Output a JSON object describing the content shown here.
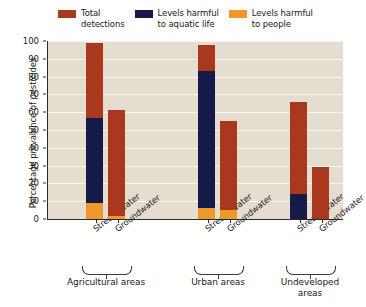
{
  "legend": {
    "items": [
      {
        "label": "Total\ndetections",
        "color": "#a8391c"
      },
      {
        "label": "Levels harmful\nto aquatic life",
        "color": "#151b46"
      },
      {
        "label": "Levels harmful\nto people",
        "color": "#f0982b"
      }
    ]
  },
  "axes": {
    "ylabel": "Percentage prevalence of pesticides",
    "yticks": [
      "0",
      "10",
      "20",
      "30",
      "40",
      "50",
      "60",
      "70",
      "80",
      "90",
      "100"
    ]
  },
  "groups": [
    {
      "label": "Agricultural areas"
    },
    {
      "label": "Urban areas"
    },
    {
      "label": "Undeveloped\nareas"
    }
  ],
  "bars": [
    {
      "name": "Stream water"
    },
    {
      "name": "Groundwater"
    },
    {
      "name": "Stream water"
    },
    {
      "name": "Groundwater"
    },
    {
      "name": "Stream water"
    },
    {
      "name": "Groundwater"
    }
  ],
  "chart_data": {
    "type": "bar",
    "title": "",
    "xlabel": "",
    "ylabel": "Percentage prevalence of pesticides",
    "ylim": [
      0,
      100
    ],
    "ytick_step": 10,
    "grid": true,
    "legend_position": "top",
    "stacked": "overlaid",
    "categories": [
      "Agricultural areas - Stream water",
      "Agricultural areas - Groundwater",
      "Urban areas - Stream water",
      "Urban areas - Groundwater",
      "Undeveloped areas - Stream water",
      "Undeveloped areas - Groundwater"
    ],
    "group_labels": [
      "Agricultural areas",
      "Urban areas",
      "Undeveloped areas"
    ],
    "sample_types": [
      "Stream water",
      "Groundwater"
    ],
    "series": [
      {
        "name": "Total detections",
        "color": "#a8391c",
        "values": [
          99,
          61,
          98,
          55,
          66,
          29
        ]
      },
      {
        "name": "Levels harmful to aquatic life",
        "color": "#151b46",
        "values": [
          57,
          0,
          83,
          0,
          14,
          0
        ]
      },
      {
        "name": "Levels harmful to people",
        "color": "#f0982b",
        "values": [
          9,
          1.5,
          6,
          5,
          0,
          0
        ]
      }
    ]
  }
}
